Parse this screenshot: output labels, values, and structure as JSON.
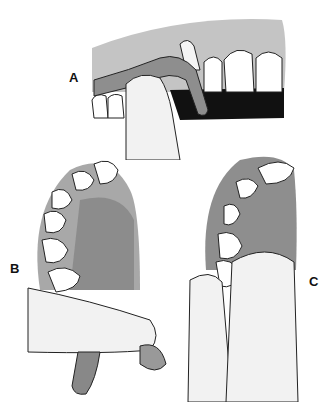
{
  "figure": {
    "panels": [
      {
        "id": "A",
        "label": "A",
        "description": "Lateral view: finger pressing impression tray/flange against upper anterior teeth and gingiva"
      },
      {
        "id": "B",
        "label": "B",
        "description": "Occlusal view of maxillary arch with palate, thumb supporting tray from below"
      },
      {
        "id": "C",
        "label": "C",
        "description": "Occlusal view of arch with two fingers stabilizing tray"
      }
    ]
  },
  "colors": {
    "gingiva": "#9a9a9a",
    "tissue_light": "#b8b8b8",
    "palate": "#8c8c8c",
    "tooth": "#ffffff",
    "finger": "#f0f0f0",
    "outline": "#222222",
    "shadow": "#111111"
  }
}
